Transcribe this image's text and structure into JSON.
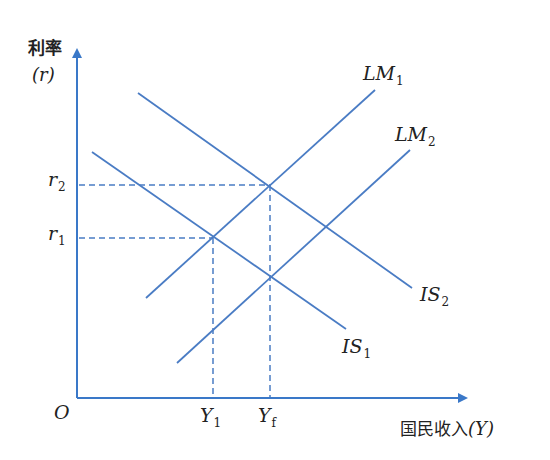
{
  "diagram": {
    "type": "IS-LM model",
    "colors": {
      "line": "#4a7cc4",
      "axis": "#3a78c8",
      "text": "#222222"
    },
    "axes": {
      "y_label": "利率",
      "y_symbol": "(r)",
      "x_label": "国民收入",
      "x_symbol": "(Y)",
      "origin": "O"
    },
    "curves": [
      {
        "id": "LM1",
        "base": "LM",
        "sub": "1",
        "x1": 146,
        "y1": 298,
        "x2": 375,
        "y2": 90
      },
      {
        "id": "LM2",
        "base": "LM",
        "sub": "2",
        "x1": 177,
        "y1": 363,
        "x2": 410,
        "y2": 150
      },
      {
        "id": "IS1",
        "base": "IS",
        "sub": "1",
        "x1": 92,
        "y1": 152,
        "x2": 346,
        "y2": 329
      },
      {
        "id": "IS2",
        "base": "IS",
        "sub": "2",
        "x1": 138,
        "y1": 93,
        "x2": 412,
        "y2": 288
      }
    ],
    "y_ticks": [
      {
        "base": "r",
        "sub": "2",
        "y": 185
      },
      {
        "base": "r",
        "sub": "1",
        "y": 238
      }
    ],
    "x_ticks": [
      {
        "base": "Y",
        "sub": "1",
        "x": 213
      },
      {
        "base": "Y",
        "sub": "f",
        "x": 270
      }
    ],
    "equilibria": [
      {
        "name": "E1",
        "x": 213,
        "y": 238,
        "rate": "r1",
        "income": "Y1"
      },
      {
        "name": "E2",
        "x": 270,
        "y": 185,
        "rate": "r2",
        "income": "Yf"
      }
    ]
  }
}
